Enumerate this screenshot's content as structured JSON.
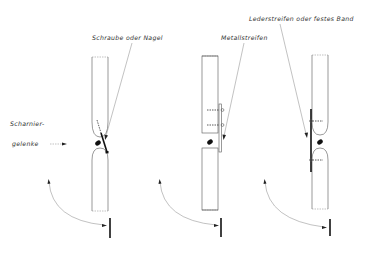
{
  "labels": {
    "screw": "Schraube oder Nagel",
    "metal": "Metallstreifen",
    "leather": "Lederstreifen oder festes Band",
    "hinge_line1": "Scharnier-",
    "hinge_line2": "gelenke"
  },
  "panels": [
    {
      "name": "screw-or-nail-joint"
    },
    {
      "name": "metal-strip-joint"
    },
    {
      "name": "leather-strip-joint"
    }
  ]
}
